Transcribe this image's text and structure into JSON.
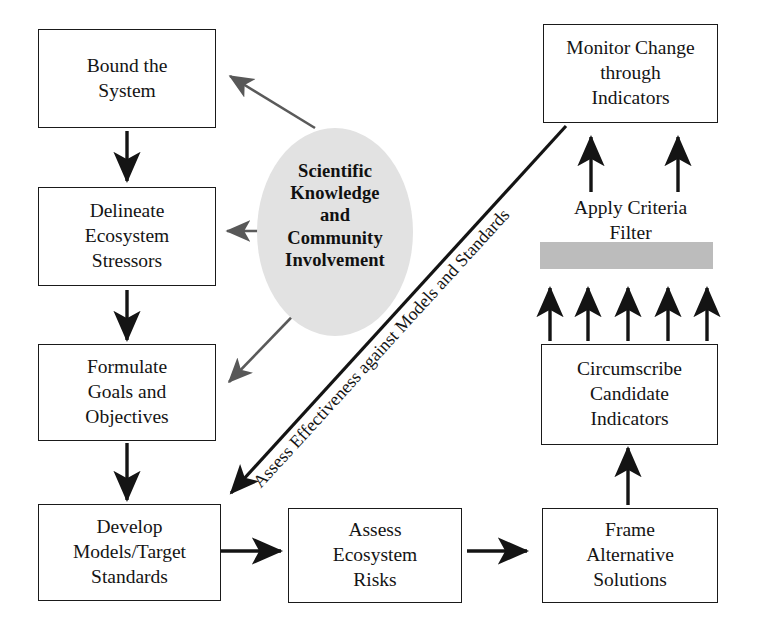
{
  "diagram": {
    "background_color": "#ffffff",
    "line_color": "#1a1a1a",
    "accent_gray_light": "#e2e2e2",
    "accent_gray_bar": "#bcbcbc",
    "soft_arrow_color": "#5a5a5a"
  },
  "boxes": {
    "bound_the_system": "Bound the\nSystem",
    "delineate_ecosystem_stressors": "Delineate\nEcosystem\nStressors",
    "formulate_goals_and_objectives": "Formulate\nGoals and\nObjectives",
    "develop_models_target_standards": "Develop\nModels/Target\nStandards",
    "assess_ecosystem_risks": "Assess\nEcosystem\nRisks",
    "frame_alternative_solutions": "Frame\nAlternative\nSolutions",
    "circumscribe_candidate_indicators": "Circumscribe\nCandidate\nIndicators",
    "monitor_change_through_indicators": "Monitor Change\nthrough\nIndicators"
  },
  "ellipse": {
    "text": "Scientific\nKnowledge\nand\nCommunity\nInvolvement",
    "fill": "#e2e2e2"
  },
  "labels": {
    "apply_criteria_filter": "Apply Criteria\nFilter",
    "assess_effectiveness": "Assess Effectiveness against Models and Standards"
  },
  "filter_bar": {
    "name": "criteria-filter-bar",
    "fill": "#bcbcbc"
  },
  "arrow_counts": {
    "below_filter_bar": 5,
    "above_filter_bar": 2
  }
}
